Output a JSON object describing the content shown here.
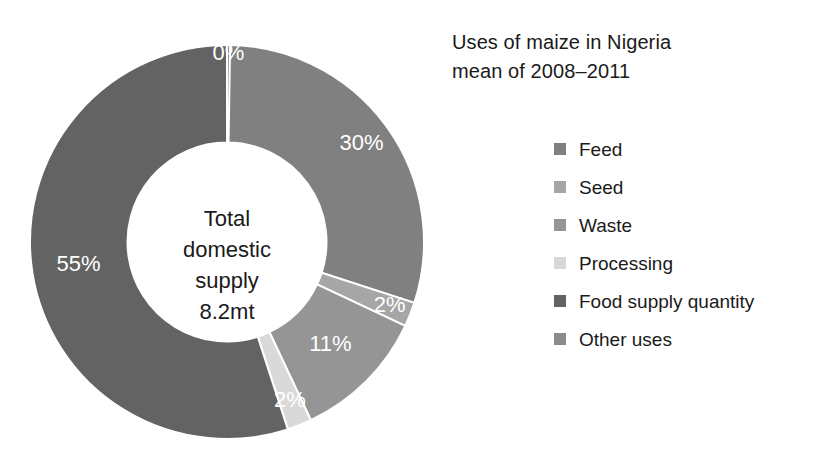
{
  "title": {
    "text": "Uses of maize in Nigeria\nmean of 2008–2011",
    "line1": "Uses of maize in Nigeria",
    "line2": "mean of 2008–2011"
  },
  "center": {
    "lines": [
      "Total",
      "domestic",
      "supply",
      "8.2mt"
    ],
    "line1": "Total",
    "line2": "domestic",
    "line3": "supply",
    "line4": "8.2mt",
    "label_full": "Total domestic supply 8.2mt"
  },
  "legend": {
    "position": "right",
    "items": [
      {
        "label": "Feed",
        "color": "#808080"
      },
      {
        "label": "Seed",
        "color": "#a6a6a6"
      },
      {
        "label": "Waste",
        "color": "#959595"
      },
      {
        "label": "Processing",
        "color": "#d9d9d9"
      },
      {
        "label": "Food supply quantity",
        "color": "#636363"
      },
      {
        "label": "Other uses",
        "color": "#8c8c8c"
      }
    ]
  },
  "chart_data": {
    "type": "pie",
    "variant": "donut",
    "title": "Uses of maize in Nigeria mean of 2008–2011",
    "subtitle": "mean of 2008–2011",
    "center_text": "Total domestic supply 8.2mt",
    "total_label": "Total domestic supply",
    "total_value": "8.2mt",
    "units": "percent of total domestic supply",
    "start_angle_deg": 0,
    "direction": "clockwise",
    "inner_radius_ratio": 0.505,
    "categories": [
      "Feed",
      "Seed",
      "Waste",
      "Processing",
      "Food supply quantity",
      "Other uses"
    ],
    "values": [
      30,
      2,
      11,
      2,
      55,
      0
    ],
    "data_labels": [
      "30%",
      "2%",
      "11%",
      "2%",
      "55%",
      "0%"
    ],
    "colors": [
      "#808080",
      "#a6a6a6",
      "#959595",
      "#d9d9d9",
      "#636363",
      "#8c8c8c"
    ],
    "label_color": "#ffffff",
    "slice_separator_color": "#ffffff",
    "legend": true,
    "legend_position": "right",
    "grid": false
  }
}
